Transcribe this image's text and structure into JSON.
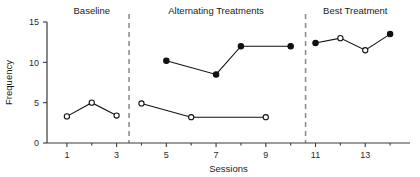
{
  "chart_data": {
    "type": "line",
    "title": "",
    "xlabel": "Sessions",
    "ylabel": "Frequency",
    "xlim": [
      0.2,
      14.8
    ],
    "ylim": [
      0,
      15
    ],
    "yticks": [
      0,
      5,
      10,
      15
    ],
    "ytick_labels": [
      "0",
      "5",
      "10",
      "15"
    ],
    "xticks": [
      1,
      3,
      5,
      7,
      9,
      11,
      13
    ],
    "xtick_labels": [
      "1",
      "3",
      "5",
      "7",
      "9",
      "11",
      "13"
    ],
    "xticks_minor": [
      2,
      4,
      6,
      8,
      10,
      12,
      14
    ],
    "grid": false,
    "legend": "none",
    "phases": [
      {
        "name": "Baseline",
        "label": "Baseline",
        "start": 1,
        "end": 3,
        "center": 2
      },
      {
        "name": "Alternating Treatments",
        "label": "Alternating Treatments",
        "start": 4,
        "end": 10,
        "center": 7
      },
      {
        "name": "Best Treatment",
        "label": "Best Treatment",
        "start": 11,
        "end": 14,
        "center": 12.6
      }
    ],
    "phase_dividers": [
      3.5,
      10.6
    ],
    "series": [
      {
        "name": "Baseline open series",
        "marker": "open-circle",
        "x": [
          1,
          2,
          3
        ],
        "values": [
          3.3,
          5.0,
          3.4
        ]
      },
      {
        "name": "Alternating treatment A (filled)",
        "marker": "filled-circle",
        "x": [
          5,
          7,
          8,
          10
        ],
        "values": [
          10.2,
          8.5,
          12.0,
          12.0
        ]
      },
      {
        "name": "Alternating treatment B (open)",
        "marker": "open-circle",
        "x": [
          4,
          6,
          9
        ],
        "values": [
          4.9,
          3.2,
          3.2
        ]
      },
      {
        "name": "Best treatment series",
        "marker": "mixed",
        "x": [
          11,
          12,
          13,
          14
        ],
        "values": [
          12.4,
          13.0,
          11.5,
          13.5
        ],
        "markers": [
          "filled-circle",
          "open-circle",
          "open-circle",
          "filled-circle"
        ]
      }
    ]
  },
  "colors": {
    "marker_fill": "#111111",
    "marker_stroke": "#111111",
    "line": "#111111",
    "axis": "#3a3a3a",
    "divider": "#8f8f8f",
    "background": "#ffffff"
  }
}
